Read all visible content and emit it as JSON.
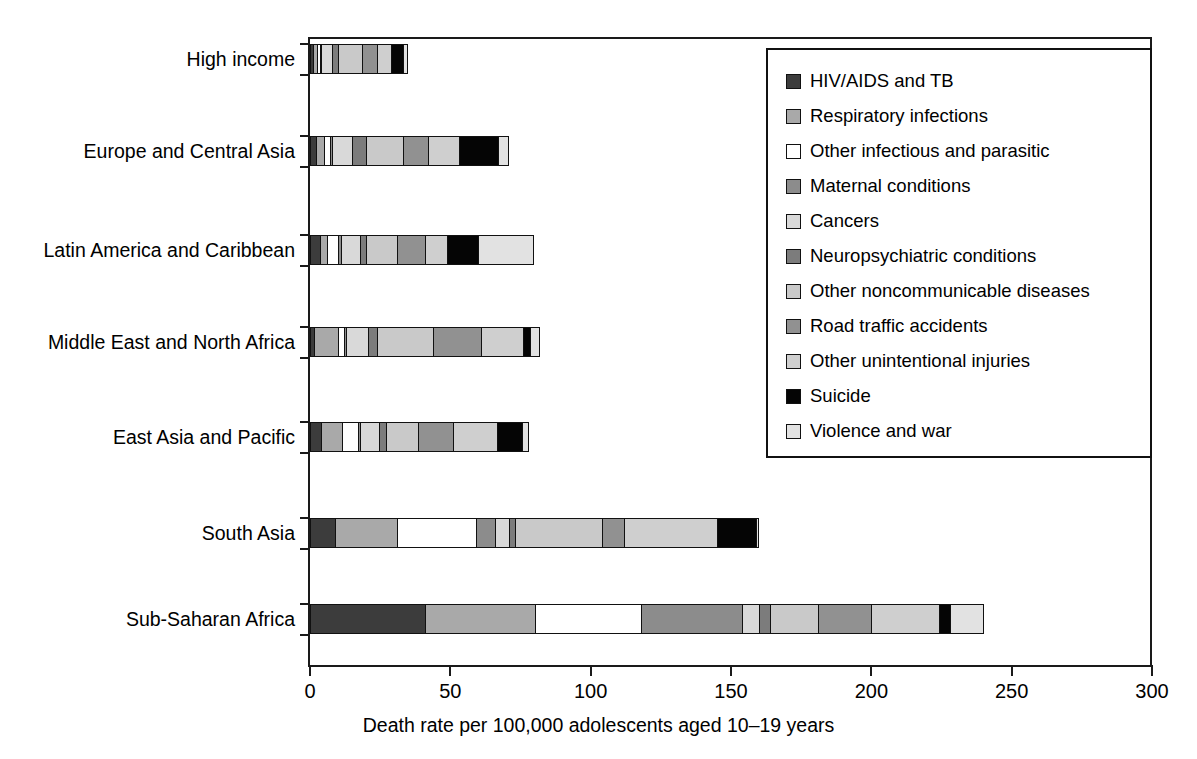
{
  "chart_data": {
    "type": "bar",
    "orientation": "horizontal",
    "stacked": true,
    "title": "",
    "xlabel": "Death rate per 100,000 adolescents aged 10–19 years",
    "ylabel": "",
    "xlim": [
      0,
      300
    ],
    "xticks": [
      0,
      50,
      100,
      150,
      200,
      250,
      300
    ],
    "grid": false,
    "legend_position": "top-right",
    "categories": [
      "High income",
      "Europe and Central Asia",
      "Latin America and Caribbean",
      "Middle East and North Africa",
      "East Asia and Pacific",
      "South Asia",
      "Sub-Saharan Africa"
    ],
    "series": [
      {
        "name": "HIV/AIDS and TB",
        "color": "#3c3c3c",
        "values": [
          1.0,
          2.0,
          3.5,
          1.5,
          4.0,
          9.0,
          41.0
        ]
      },
      {
        "name": "Respiratory infections",
        "color": "#a9a9a9",
        "values": [
          1.5,
          3.0,
          2.5,
          8.5,
          7.5,
          22.0,
          39.0
        ]
      },
      {
        "name": "Other infectious and parasitic",
        "color": "#ffffff",
        "values": [
          1.0,
          2.0,
          4.0,
          2.0,
          5.5,
          28.0,
          38.0
        ]
      },
      {
        "name": "Maternal conditions",
        "color": "#8c8c8c",
        "values": [
          0.5,
          1.0,
          1.0,
          1.0,
          1.0,
          7.0,
          36.0
        ]
      },
      {
        "name": "Cancers",
        "color": "#d9d9d9",
        "values": [
          4.0,
          7.0,
          7.0,
          7.5,
          6.5,
          5.0,
          6.0
        ]
      },
      {
        "name": "Neuropsychiatric conditions",
        "color": "#7c7c7c",
        "values": [
          2.0,
          5.0,
          2.0,
          3.5,
          2.5,
          2.0,
          4.0
        ]
      },
      {
        "name": "Other noncommunicable diseases",
        "color": "#c9c9c9",
        "values": [
          8.5,
          13.0,
          11.0,
          20.0,
          11.5,
          31.0,
          17.0
        ]
      },
      {
        "name": "Road traffic accidents",
        "color": "#919191",
        "values": [
          5.5,
          9.0,
          10.0,
          17.0,
          12.5,
          8.0,
          19.0
        ]
      },
      {
        "name": "Other unintentional injuries",
        "color": "#cfcfcf",
        "values": [
          5.0,
          11.0,
          8.0,
          15.0,
          15.5,
          33.0,
          24.0
        ]
      },
      {
        "name": "Suicide",
        "color": "#050505",
        "values": [
          4.0,
          14.0,
          11.0,
          2.5,
          9.0,
          14.0,
          4.0
        ]
      },
      {
        "name": "Violence and war",
        "color": "#e2e2e2",
        "values": [
          2.0,
          4.0,
          20.0,
          3.5,
          2.5,
          1.0,
          12.0
        ]
      }
    ],
    "totals": [
      35,
      71,
      80,
      82,
      78,
      160,
      240
    ]
  },
  "axis": {
    "tick_labels": [
      "0",
      "50",
      "100",
      "150",
      "200",
      "250",
      "300"
    ],
    "title": "Death rate per 100,000 adolescents aged 10–19 years"
  },
  "legend": {
    "items": [
      {
        "label": "HIV/AIDS and TB",
        "color": "#3c3c3c"
      },
      {
        "label": "Respiratory infections",
        "color": "#a9a9a9"
      },
      {
        "label": "Other infectious and parasitic",
        "color": "#ffffff"
      },
      {
        "label": "Maternal conditions",
        "color": "#8c8c8c"
      },
      {
        "label": "Cancers",
        "color": "#d9d9d9"
      },
      {
        "label": "Neuropsychiatric conditions",
        "color": "#7c7c7c"
      },
      {
        "label": "Other noncommunicable diseases",
        "color": "#c9c9c9"
      },
      {
        "label": "Road traffic accidents",
        "color": "#919191"
      },
      {
        "label": "Other unintentional injuries",
        "color": "#cfcfcf"
      },
      {
        "label": "Suicide",
        "color": "#050505"
      },
      {
        "label": "Violence and war",
        "color": "#e2e2e2"
      }
    ]
  }
}
